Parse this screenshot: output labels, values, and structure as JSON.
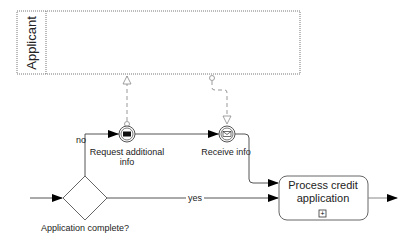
{
  "diagram": {
    "type": "BPMN process",
    "pool": {
      "label": "Applicant"
    },
    "events": [
      {
        "id": "request",
        "label_line1": "Request additional",
        "label_line2": "info",
        "kind": "intermediate-throw-message"
      },
      {
        "id": "receive",
        "label": "Receive info",
        "kind": "intermediate-catch-message"
      }
    ],
    "gateway": {
      "label": "Application complete?",
      "kind": "exclusive"
    },
    "task": {
      "label_line1": "Process credit",
      "label_line2": "application",
      "marker": "+",
      "kind": "collapsed-subprocess"
    },
    "flows": {
      "no_label": "no",
      "yes_label": "yes"
    },
    "colors": {
      "stroke": "#444444",
      "message_flow": "#999999",
      "pool_border": "#777777",
      "arrow": "#000000"
    }
  }
}
